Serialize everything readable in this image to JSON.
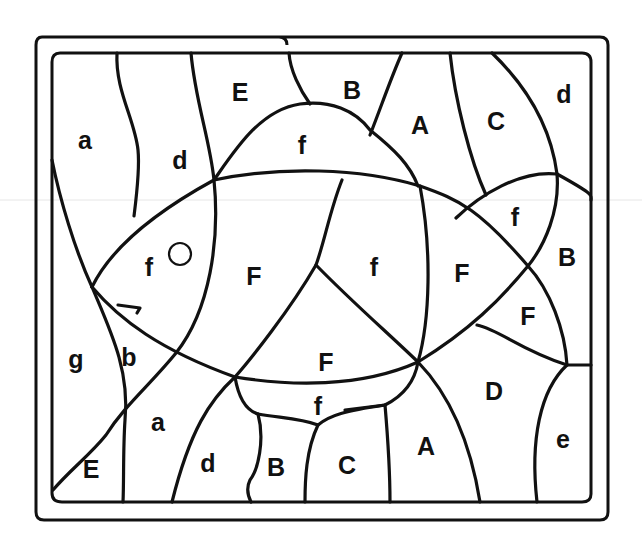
{
  "puzzle": {
    "type": "letter-coded coloring page",
    "subject": "fish",
    "ink_color": "#111111",
    "paper_color": "#ffffff",
    "regions": [
      {
        "id": "r1",
        "letter": "a",
        "zone": "background top-left"
      },
      {
        "id": "r2",
        "letter": "d",
        "zone": "background top, left of fin"
      },
      {
        "id": "r3",
        "letter": "E",
        "zone": "background top"
      },
      {
        "id": "r4",
        "letter": "f",
        "zone": "dorsal fin"
      },
      {
        "id": "r5",
        "letter": "B",
        "zone": "background top"
      },
      {
        "id": "r6",
        "letter": "A",
        "zone": "background top"
      },
      {
        "id": "r7",
        "letter": "C",
        "zone": "background top-right"
      },
      {
        "id": "r8",
        "letter": "d",
        "zone": "background top-right corner"
      },
      {
        "id": "r9",
        "letter": "f",
        "zone": "fish head"
      },
      {
        "id": "r10",
        "letter": "F",
        "zone": "fish body"
      },
      {
        "id": "r11",
        "letter": "f",
        "zone": "fish body"
      },
      {
        "id": "r12",
        "letter": "F",
        "zone": "fish body rear"
      },
      {
        "id": "r13",
        "letter": "f",
        "zone": "tail upper"
      },
      {
        "id": "r14",
        "letter": "B",
        "zone": "background right"
      },
      {
        "id": "r15",
        "letter": "F",
        "zone": "tail lower"
      },
      {
        "id": "r16",
        "letter": "F",
        "zone": "fish belly"
      },
      {
        "id": "r17",
        "letter": "g",
        "zone": "background left"
      },
      {
        "id": "r18",
        "letter": "b",
        "zone": "fish mouth"
      },
      {
        "id": "r19",
        "letter": "f",
        "zone": "belly fin"
      },
      {
        "id": "r20",
        "letter": "D",
        "zone": "background lower-right"
      },
      {
        "id": "r21",
        "letter": "a",
        "zone": "background bottom"
      },
      {
        "id": "r22",
        "letter": "E",
        "zone": "background bottom-left corner"
      },
      {
        "id": "r23",
        "letter": "d",
        "zone": "background bottom"
      },
      {
        "id": "r24",
        "letter": "B",
        "zone": "background bottom"
      },
      {
        "id": "r25",
        "letter": "C",
        "zone": "background bottom"
      },
      {
        "id": "r26",
        "letter": "A",
        "zone": "background bottom"
      },
      {
        "id": "r27",
        "letter": "e",
        "zone": "background bottom-right"
      }
    ]
  }
}
